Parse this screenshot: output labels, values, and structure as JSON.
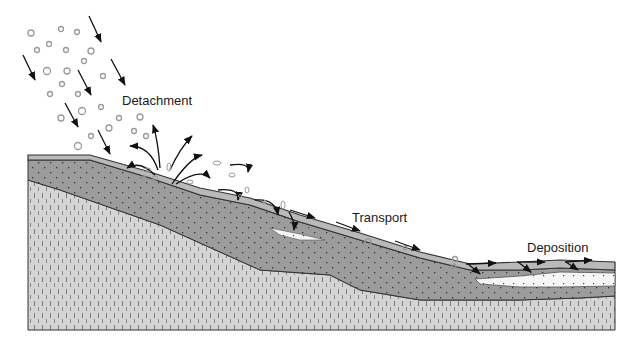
{
  "diagram": {
    "labels": {
      "detachment": "Detachment",
      "transport": "Transport",
      "deposition": "Deposition"
    },
    "layers": [
      {
        "name": "topsoil-surface-layer",
        "color": "#b9b9b9"
      },
      {
        "name": "soil-layer",
        "color": "#9c9c9c"
      },
      {
        "name": "subsoil-bedrock",
        "color": "#d4d4d4"
      },
      {
        "name": "deposited-sediment",
        "color": "#f4f4f4"
      }
    ],
    "colors": {
      "outline": "#333333",
      "arrow": "#111111",
      "raindrop": "#9a9a9a"
    }
  }
}
